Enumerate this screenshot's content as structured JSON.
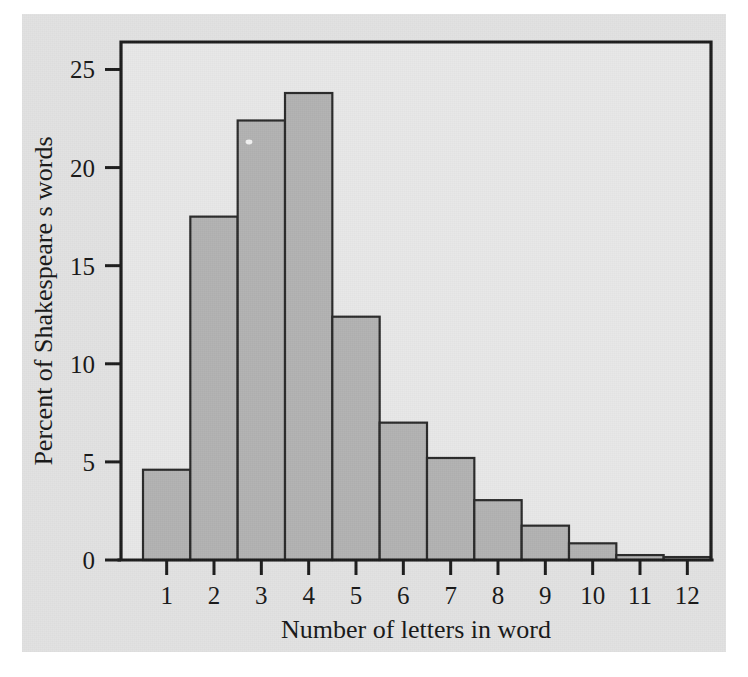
{
  "figure": {
    "paper_color": "#e2e2e2",
    "plot_bg_color": "#e8e8e8",
    "bar_fill_color": "#b2b2b2",
    "bar_edge_color": "#2a2a2a",
    "axis_color": "#1c1c1c"
  },
  "chart_data": {
    "type": "bar",
    "title": "",
    "subtitle": "",
    "xlabel": "Number of letters in word",
    "ylabel": "Percent of Shakespeare s words",
    "categories": [
      "1",
      "2",
      "3",
      "4",
      "5",
      "6",
      "7",
      "8",
      "9",
      "10",
      "11",
      "12"
    ],
    "values": [
      4.6,
      17.5,
      22.4,
      23.8,
      12.4,
      7.0,
      5.2,
      3.05,
      1.75,
      0.85,
      0.25,
      0.15
    ],
    "series": [
      {
        "name": "Percent of Shakespeare s words",
        "values": [
          4.6,
          17.5,
          22.4,
          23.8,
          12.4,
          7.0,
          5.2,
          3.05,
          1.75,
          0.85,
          0.25,
          0.15
        ]
      }
    ],
    "x_tick_labels": [
      "1",
      "2",
      "3",
      "4",
      "5",
      "6",
      "7",
      "8",
      "9",
      "10",
      "11",
      "12"
    ],
    "y_tick_labels": [
      "0",
      "5",
      "10",
      "15",
      "20",
      "25"
    ],
    "y_tick_values": [
      0,
      5,
      10,
      15,
      20,
      25
    ],
    "ylim": [
      0,
      26.4
    ],
    "xlim": [
      0.5,
      12.5
    ],
    "grid": false,
    "legend": false,
    "legend_position": "none",
    "annotations": []
  }
}
